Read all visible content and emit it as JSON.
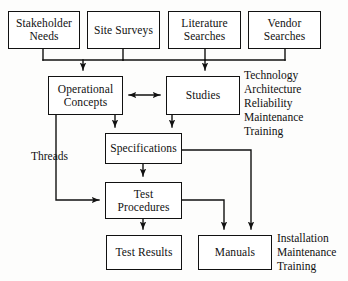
{
  "diagram": {
    "line_color": "#111111",
    "box_fill": "#ffffff",
    "nodes": [
      {
        "id": "stakeholder_needs",
        "label": "Stakeholder\nNeeds",
        "x": 8,
        "y": 11,
        "w": 72,
        "h": 38
      },
      {
        "id": "site_surveys",
        "label": "Site Surveys",
        "x": 87,
        "y": 11,
        "w": 73,
        "h": 38
      },
      {
        "id": "literature_searches",
        "label": "Literature\nSearches",
        "x": 168,
        "y": 11,
        "w": 73,
        "h": 38
      },
      {
        "id": "vendor_searches",
        "label": "Vendor\nSearches",
        "x": 248,
        "y": 11,
        "w": 73,
        "h": 38
      },
      {
        "id": "operational_concepts",
        "label": "Operational\nConcepts",
        "x": 48,
        "y": 76,
        "w": 75,
        "h": 39
      },
      {
        "id": "studies",
        "label": "Studies",
        "x": 166,
        "y": 76,
        "w": 74,
        "h": 39
      },
      {
        "id": "specifications",
        "label": "Specifications",
        "x": 105,
        "y": 133,
        "w": 77,
        "h": 31
      },
      {
        "id": "test_procedures",
        "label": "Test\nProcedures",
        "x": 105,
        "y": 182,
        "w": 77,
        "h": 37
      },
      {
        "id": "test_results",
        "label": "Test Results",
        "x": 106,
        "y": 235,
        "w": 76,
        "h": 35
      },
      {
        "id": "manuals",
        "label": "Manuals",
        "x": 198,
        "y": 235,
        "w": 74,
        "h": 35
      }
    ],
    "edge_labels": [
      {
        "id": "threads",
        "text": "Threads",
        "x": 31,
        "y": 150
      }
    ],
    "annotations": [
      {
        "id": "studies-attributes",
        "x": 244,
        "y": 68,
        "lines": [
          "Technology",
          "Architecture",
          "Reliability",
          "Maintenance",
          "Training"
        ]
      },
      {
        "id": "manuals-attributes",
        "x": 277,
        "y": 231,
        "lines": [
          "Installation",
          "Maintenance",
          "Training"
        ]
      }
    ]
  }
}
